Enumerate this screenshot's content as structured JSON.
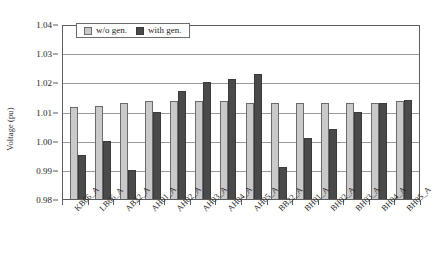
{
  "chart_data": {
    "type": "bar",
    "title": "",
    "xlabel": "",
    "ylabel": "Voltage (pu)",
    "ylim": [
      0.98,
      1.04
    ],
    "ytick_labels": [
      "1.04",
      "1.03",
      "1.02",
      "1.01",
      "1.00",
      "0.99",
      "0.98"
    ],
    "ytick_values": [
      1.04,
      1.03,
      1.02,
      1.01,
      1.0,
      0.99,
      0.98
    ],
    "grid": true,
    "legend_position": "top-left-inside",
    "categories": [
      "KB66_A",
      "LB66_A",
      "AB22_A",
      "AH01_A",
      "AH02_A",
      "AH03_A",
      "AH04_A",
      "AH05_A",
      "BB22_A",
      "BH01_A",
      "BH02_A",
      "BH03_A",
      "BH04_A",
      "BH05_A"
    ],
    "series": [
      {
        "name": "w/o gen.",
        "color": "#c9c9c9",
        "values": [
          1.0115,
          1.012,
          1.013,
          1.0135,
          1.0135,
          1.0135,
          1.0135,
          1.013,
          1.013,
          1.013,
          1.013,
          1.013,
          1.013,
          1.0135
        ]
      },
      {
        "name": "with gen.",
        "color": "#4a4a4a",
        "values": [
          0.995,
          0.9998,
          0.99,
          1.01,
          1.017,
          1.02,
          1.021,
          1.023,
          0.991,
          1.001,
          1.004,
          1.01,
          1.013,
          1.014
        ]
      }
    ]
  },
  "legend": {
    "items": [
      {
        "label": "w/o gen.",
        "swatch": "light-gray-square-icon"
      },
      {
        "label": "with gen.",
        "swatch": "dark-gray-square-icon"
      }
    ]
  }
}
